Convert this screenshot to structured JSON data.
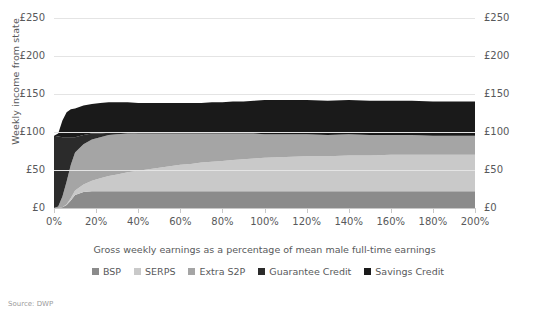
{
  "chart_data": {
    "type": "area",
    "stacked": true,
    "title": "",
    "subtitle": "",
    "xlabel": "Gross weekly earnings as a percentage of mean male full-time earnings",
    "ylabel": "Weekly income from state",
    "xlim": [
      0,
      200
    ],
    "ylim": [
      0,
      250
    ],
    "grid": true,
    "legend_position": "bottom",
    "x_tick_labels": [
      "0%",
      "20%",
      "40%",
      "60%",
      "80%",
      "100%",
      "120%",
      "140%",
      "160%",
      "180%",
      "200%"
    ],
    "x_tick_values": [
      0,
      20,
      40,
      60,
      80,
      100,
      120,
      140,
      160,
      180,
      200
    ],
    "y_tick_labels": [
      "£0",
      "£50",
      "£100",
      "£150",
      "£200",
      "£250"
    ],
    "y_tick_values": [
      0,
      50,
      100,
      150,
      200,
      250
    ],
    "y_axis_right_labels": [
      "£0",
      "£50",
      "£100",
      "£150",
      "£200",
      "£250"
    ],
    "x": [
      0,
      2,
      4,
      6,
      8,
      10,
      14,
      18,
      22,
      26,
      30,
      35,
      40,
      45,
      50,
      55,
      60,
      65,
      70,
      75,
      80,
      85,
      90,
      95,
      100,
      110,
      120,
      130,
      140,
      150,
      160,
      170,
      180,
      190,
      200
    ],
    "series": [
      {
        "name": "BSP",
        "color": "#8b8b8b",
        "values": [
          0,
          0,
          1,
          4,
          10,
          17,
          21,
          22,
          22,
          22,
          22,
          22,
          22,
          22,
          22,
          22,
          22,
          22,
          22,
          22,
          22,
          22,
          22,
          22,
          22,
          22,
          22,
          22,
          22,
          22,
          22,
          22,
          22,
          22,
          22
        ]
      },
      {
        "name": "SERPS",
        "color": "#c9c9c9",
        "values": [
          0,
          0,
          0,
          1,
          3,
          6,
          10,
          14,
          17,
          20,
          22,
          25,
          27,
          29,
          31,
          33,
          35,
          36,
          38,
          39,
          40,
          41,
          42,
          43,
          44,
          45,
          46,
          46,
          47,
          47,
          48,
          48,
          48,
          48,
          48
        ]
      },
      {
        "name": "Extra S2P",
        "color": "#a5a5a5",
        "values": [
          0,
          2,
          14,
          30,
          44,
          50,
          53,
          54,
          54,
          54,
          53,
          51,
          49,
          47,
          45,
          43,
          41,
          40,
          38,
          37,
          36,
          35,
          34,
          33,
          31,
          30,
          29,
          28,
          28,
          27,
          26,
          26,
          25,
          25,
          25
        ]
      },
      {
        "name": "Guarantee Credit",
        "color": "#2b2b2b",
        "values": [
          95,
          92,
          78,
          58,
          36,
          20,
          12,
          8,
          5,
          3,
          2,
          1,
          0,
          0,
          0,
          0,
          0,
          0,
          0,
          0,
          0,
          0,
          0,
          0,
          0,
          0,
          0,
          0,
          0,
          0,
          0,
          0,
          0,
          0,
          0
        ]
      },
      {
        "name": "Savings Credit",
        "color": "#1a1a1a",
        "values": [
          0,
          4,
          22,
          33,
          37,
          38,
          39,
          39,
          40,
          40,
          40,
          40,
          40,
          40,
          40,
          40,
          40,
          40,
          40,
          41,
          41,
          42,
          42,
          43,
          45,
          45,
          45,
          45,
          45,
          45,
          45,
          45,
          45,
          45,
          45
        ]
      }
    ]
  },
  "legend": {
    "items": [
      {
        "label": "BSP",
        "color": "#8b8b8b"
      },
      {
        "label": "SERPS",
        "color": "#c9c9c9"
      },
      {
        "label": "Extra S2P",
        "color": "#a5a5a5"
      },
      {
        "label": "Guarantee Credit",
        "color": "#2b2b2b"
      },
      {
        "label": "Savings Credit",
        "color": "#1a1a1a"
      }
    ]
  },
  "footer": {
    "source": "Source: DWP"
  },
  "style": {
    "background": "#ffffff",
    "gridline_color": "#e4e4e4",
    "axis_color": "#c8c8c8",
    "text_color": "#58595b"
  }
}
